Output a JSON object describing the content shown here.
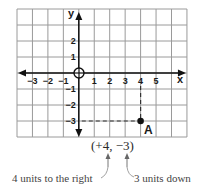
{
  "diagram": {
    "type": "coordinate-plane",
    "grid": {
      "x_min": -4,
      "x_max": 7,
      "y_min": -4,
      "y_max": 4,
      "left_px": 17,
      "top_px": 9,
      "cell_w": 15.45,
      "cell_h": 16,
      "line_color": "#9a9a9a",
      "axis_color": "#111111"
    },
    "axes": {
      "x_label": "x",
      "y_label": "y",
      "x_ticks": [
        {
          "value": -3,
          "label": "−3"
        },
        {
          "value": -2,
          "label": "−2"
        },
        {
          "value": -1,
          "label": "−1"
        },
        {
          "value": 1,
          "label": "1"
        },
        {
          "value": 2,
          "label": "2"
        },
        {
          "value": 3,
          "label": "3"
        },
        {
          "value": 4,
          "label": "4"
        },
        {
          "value": 5,
          "label": "5"
        }
      ],
      "y_ticks": [
        {
          "value": 2,
          "label": "2"
        },
        {
          "value": 1,
          "label": "1"
        },
        {
          "value": -1,
          "label": "−1"
        },
        {
          "value": -2,
          "label": "−2"
        },
        {
          "value": -3,
          "label": "−3"
        }
      ]
    },
    "point": {
      "name": "A",
      "x": 4,
      "y": -3,
      "color": "#111111"
    },
    "coordinate_text": "(+4, −3)",
    "annotations": {
      "left_note": "4 units to the right",
      "right_note": "3 units down"
    }
  }
}
